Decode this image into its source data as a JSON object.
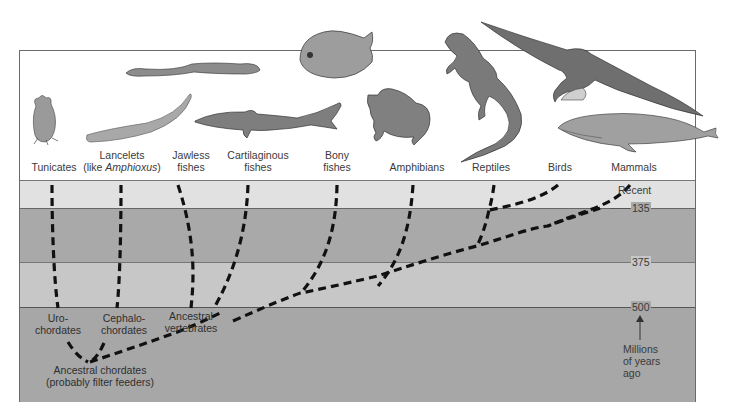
{
  "diagram": {
    "type": "phylogenetic-tree",
    "taxa": [
      {
        "id": "tunicates",
        "label": "Tunicates"
      },
      {
        "id": "lancelets",
        "label_line1": "Lancelets",
        "label_line2_prefix": "(like ",
        "label_line2_italic": "Amphioxus",
        "label_line2_suffix": ")"
      },
      {
        "id": "jawless",
        "label_line1": "Jawless",
        "label_line2": "fishes"
      },
      {
        "id": "cartilaginous",
        "label_line1": "Cartilaginous",
        "label_line2": "fishes"
      },
      {
        "id": "bony",
        "label_line1": "Bony",
        "label_line2": "fishes"
      },
      {
        "id": "amphibians",
        "label": "Amphibians"
      },
      {
        "id": "reptiles",
        "label": "Reptiles"
      },
      {
        "id": "birds",
        "label": "Birds"
      },
      {
        "id": "mammals",
        "label": "Mammals"
      }
    ],
    "nodes": {
      "urochordates": {
        "line1": "Uro-",
        "line2": "chordates"
      },
      "cephalochordates": {
        "line1": "Cephalo-",
        "line2": "chordates"
      },
      "ancestral_vertebrates": {
        "line1": "Ancestral",
        "line2": "vertebrates"
      },
      "ancestral_chordates": {
        "line1": "Ancestral chordates",
        "line2": "(probably filter feeders)"
      }
    },
    "time_axis": {
      "recent_label": "Recent",
      "ticks": [
        "135",
        "375",
        "500"
      ],
      "unit_line1": "Millions",
      "unit_line2": "of years",
      "unit_line3": "ago"
    },
    "illustrations": [
      "tunicate",
      "lancelet",
      "lamprey",
      "shark",
      "piranha",
      "frog",
      "iguana",
      "albatross",
      "whale"
    ],
    "colors": {
      "band_recent": "#e1e1e1",
      "band_dark": "#a9a9a9",
      "band_mid": "#c7c7c7",
      "branch": "#111111"
    }
  }
}
